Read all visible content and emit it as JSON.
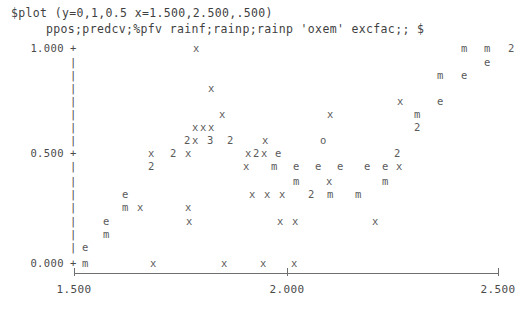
{
  "header": {
    "line1": "$plot (y=0,1,0.5 x=1.500,2.500,.500)",
    "line2": "ppos;predcv;%pfv rainf;rainp;rainp 'oxem' excfac;; $"
  },
  "chart_data": {
    "type": "scatter",
    "title": "",
    "subtitle": "",
    "xlabel": "",
    "ylabel": "",
    "xlim": [
      1.5,
      2.5
    ],
    "ylim": [
      0.0,
      1.0
    ],
    "grid": false,
    "legend": "",
    "render_style": "ascii-character-plot",
    "axis_glyphs": {
      "tick_mark": "+",
      "axis_column": "|",
      "origin_mark": "+"
    },
    "y_ticks": [
      {
        "label": "1.000",
        "value": 1.0
      },
      {
        "label": "0.500",
        "value": 0.5
      },
      {
        "label": "0.000",
        "value": 0.0
      }
    ],
    "x_ticks": [
      {
        "label": "1.500",
        "value": 1.5
      },
      {
        "label": "2.000",
        "value": 2.0
      },
      {
        "label": "2.500",
        "value": 2.5
      }
    ],
    "series_symbols": [
      {
        "symbol": "x",
        "meaning": "single-point-x"
      },
      {
        "symbol": "e",
        "meaning": "single-point-e"
      },
      {
        "symbol": "m",
        "meaning": "single-point-m"
      },
      {
        "symbol": "o",
        "meaning": "single-point-o"
      },
      {
        "symbol": "2",
        "meaning": "two-coincident-points"
      },
      {
        "symbol": "3",
        "meaning": "three-coincident-points"
      }
    ],
    "rows": [
      {
        "y": 48,
        "glyphs": [
          {
            "x": 193,
            "c": "x"
          },
          {
            "x": 461,
            "c": "m"
          },
          {
            "x": 484,
            "c": "m"
          },
          {
            "x": 508,
            "c": "2"
          }
        ]
      },
      {
        "y": 62,
        "glyphs": [
          {
            "x": 484,
            "c": "e"
          }
        ]
      },
      {
        "y": 75,
        "glyphs": [
          {
            "x": 437,
            "c": "m"
          },
          {
            "x": 461,
            "c": "e"
          }
        ]
      },
      {
        "y": 88,
        "glyphs": [
          {
            "x": 208,
            "c": "x"
          }
        ]
      },
      {
        "y": 101,
        "glyphs": [
          {
            "x": 397,
            "c": "x"
          },
          {
            "x": 437,
            "c": "e"
          }
        ]
      },
      {
        "y": 114,
        "glyphs": [
          {
            "x": 219,
            "c": "x"
          },
          {
            "x": 327,
            "c": "x"
          },
          {
            "x": 414,
            "c": "m"
          }
        ]
      },
      {
        "y": 127,
        "glyphs": [
          {
            "x": 192,
            "c": "x"
          },
          {
            "x": 200,
            "c": "x"
          },
          {
            "x": 208,
            "c": "x"
          },
          {
            "x": 414,
            "c": "2"
          }
        ]
      },
      {
        "y": 140,
        "glyphs": [
          {
            "x": 184,
            "c": "2"
          },
          {
            "x": 192,
            "c": "x"
          },
          {
            "x": 207,
            "c": "3"
          },
          {
            "x": 227,
            "c": "2"
          },
          {
            "x": 262,
            "c": "x"
          },
          {
            "x": 320,
            "c": "o"
          }
        ]
      },
      {
        "y": 153,
        "glyphs": [
          {
            "x": 148,
            "c": "x"
          },
          {
            "x": 170,
            "c": "2"
          },
          {
            "x": 185,
            "c": "x"
          },
          {
            "x": 245,
            "c": "x"
          },
          {
            "x": 253,
            "c": "2"
          },
          {
            "x": 261,
            "c": "x"
          },
          {
            "x": 275,
            "c": "e"
          },
          {
            "x": 394,
            "c": "2"
          }
        ]
      },
      {
        "y": 166,
        "glyphs": [
          {
            "x": 148,
            "c": "2"
          },
          {
            "x": 243,
            "c": "x"
          },
          {
            "x": 271,
            "c": "m"
          },
          {
            "x": 293,
            "c": "e"
          },
          {
            "x": 315,
            "c": "e"
          },
          {
            "x": 337,
            "c": "e"
          },
          {
            "x": 364,
            "c": "e"
          },
          {
            "x": 382,
            "c": "e"
          },
          {
            "x": 396,
            "c": "x"
          }
        ]
      },
      {
        "y": 181,
        "glyphs": [
          {
            "x": 293,
            "c": "m"
          },
          {
            "x": 326,
            "c": "x"
          },
          {
            "x": 382,
            "c": "m"
          }
        ]
      },
      {
        "y": 194,
        "glyphs": [
          {
            "x": 122,
            "c": "e"
          },
          {
            "x": 249,
            "c": "x"
          },
          {
            "x": 264,
            "c": "x"
          },
          {
            "x": 279,
            "c": "x"
          },
          {
            "x": 308,
            "c": "2"
          },
          {
            "x": 327,
            "c": "m"
          },
          {
            "x": 355,
            "c": "m"
          }
        ]
      },
      {
        "y": 207,
        "glyphs": [
          {
            "x": 122,
            "c": "m"
          },
          {
            "x": 137,
            "c": "x"
          },
          {
            "x": 185,
            "c": "x"
          }
        ]
      },
      {
        "y": 221,
        "glyphs": [
          {
            "x": 103,
            "c": "e"
          },
          {
            "x": 186,
            "c": "x"
          },
          {
            "x": 277,
            "c": "x"
          },
          {
            "x": 292,
            "c": "x"
          },
          {
            "x": 372,
            "c": "x"
          }
        ]
      },
      {
        "y": 234,
        "glyphs": [
          {
            "x": 103,
            "c": "m"
          }
        ]
      },
      {
        "y": 247,
        "glyphs": [
          {
            "x": 82,
            "c": "e"
          }
        ]
      },
      {
        "y": 263,
        "glyphs": [
          {
            "x": 82,
            "c": "m"
          },
          {
            "x": 150,
            "c": "x"
          },
          {
            "x": 221,
            "c": "x"
          },
          {
            "x": 260,
            "c": "x"
          },
          {
            "x": 291,
            "c": "x"
          }
        ]
      }
    ],
    "axis_column_rows": [
      {
        "y": 48,
        "c": "+"
      },
      {
        "y": 62,
        "c": "|"
      },
      {
        "y": 75,
        "c": "|"
      },
      {
        "y": 88,
        "c": "|"
      },
      {
        "y": 101,
        "c": "|"
      },
      {
        "y": 114,
        "c": "|"
      },
      {
        "y": 127,
        "c": "|"
      },
      {
        "y": 140,
        "c": "|"
      },
      {
        "y": 153,
        "c": "+"
      },
      {
        "y": 166,
        "c": "|"
      },
      {
        "y": 181,
        "c": "|"
      },
      {
        "y": 194,
        "c": "|"
      },
      {
        "y": 207,
        "c": "|"
      },
      {
        "y": 221,
        "c": "|"
      },
      {
        "y": 234,
        "c": "|"
      },
      {
        "y": 247,
        "c": "|"
      },
      {
        "y": 263,
        "c": "+"
      }
    ],
    "y_tick_label_rows": [
      {
        "y": 48,
        "label": "1.000"
      },
      {
        "y": 153,
        "label": "0.500"
      },
      {
        "y": 263,
        "label": "0.000"
      }
    ],
    "x_tick_positions": [
      {
        "x": 74,
        "label": "1.500"
      },
      {
        "x": 287,
        "label": "2.000"
      },
      {
        "x": 498,
        "label": "2.500"
      }
    ]
  },
  "colors": {
    "background": "#ffffff",
    "text": "#4a4a4a",
    "glyph": "#5a5a5a",
    "axis": "#6f6f6f"
  }
}
